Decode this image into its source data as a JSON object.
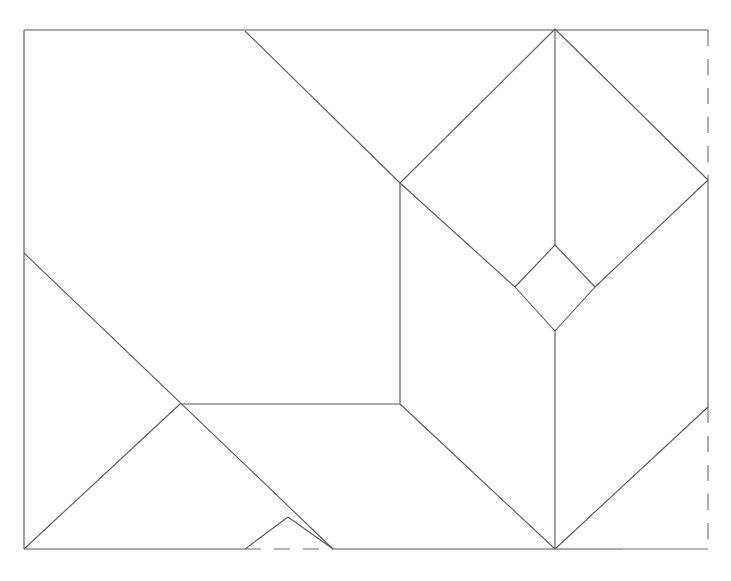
{
  "figure": {
    "kind": "line-diagram",
    "background_color": "#ffffff",
    "line_color": "#59595c",
    "dashed_line_color": "#6c6c70",
    "canvas": {
      "width": 731,
      "height": 581
    },
    "bounding_box": {
      "left": 24,
      "top": 30,
      "right": 708,
      "bottom": 549
    },
    "vertices": {
      "top_left": [
        24,
        30
      ],
      "top_right": [
        708,
        30
      ],
      "bottom_left": [
        24,
        549
      ],
      "bottom_right": [
        708,
        549
      ],
      "top_edge_crease": [
        245,
        31
      ],
      "apex_top": [
        555,
        29
      ],
      "left_edge_crease": [
        24,
        253
      ],
      "mid_left_node": [
        180,
        404
      ],
      "mid_right_node": [
        400,
        404
      ],
      "upper_mid_node": [
        400,
        183
      ],
      "right_diamond_node": [
        708,
        180
      ],
      "lower_right_node": [
        708,
        407
      ],
      "bottom_apex": [
        555,
        549
      ],
      "small_diamond_top": [
        555,
        245
      ],
      "small_diamond_left": [
        515,
        287
      ],
      "small_diamond_right": [
        595,
        287
      ],
      "small_diamond_bottom": [
        555,
        331
      ],
      "small_tri_apex": [
        288,
        517
      ],
      "small_tri_base_left": [
        245,
        549
      ],
      "small_tri_base_right": [
        333,
        549
      ]
    },
    "segments": [
      {
        "name": "outer-top-edge",
        "style": "solid",
        "from": [
          24,
          30
        ],
        "to": [
          708,
          30
        ]
      },
      {
        "name": "outer-left-edge",
        "style": "solid",
        "from": [
          24,
          30
        ],
        "to": [
          24,
          549
        ]
      },
      {
        "name": "outer-bottom-edge-left",
        "style": "solid",
        "from": [
          24,
          549
        ],
        "to": [
          245,
          549
        ]
      },
      {
        "name": "outer-bottom-edge-gap",
        "style": "dashed",
        "from": [
          245,
          549
        ],
        "to": [
          333,
          549
        ]
      },
      {
        "name": "outer-bottom-edge-mid",
        "style": "solid",
        "from": [
          333,
          549
        ],
        "to": [
          622,
          549
        ]
      },
      {
        "name": "outer-bottom-edge-right",
        "style": "solid-faint",
        "from": [
          622,
          549
        ],
        "to": [
          708,
          549
        ]
      },
      {
        "name": "outer-right-edge-upper",
        "style": "dashed",
        "from": [
          708,
          30
        ],
        "to": [
          708,
          180
        ]
      },
      {
        "name": "outer-right-edge-middle",
        "style": "solid",
        "from": [
          708,
          180
        ],
        "to": [
          708,
          407
        ]
      },
      {
        "name": "outer-right-edge-lower",
        "style": "dashed",
        "from": [
          708,
          407
        ],
        "to": [
          708,
          549
        ]
      },
      {
        "name": "crease-top-left-diagonal",
        "style": "solid",
        "from": [
          245,
          31
        ],
        "to": [
          400,
          183
        ]
      },
      {
        "name": "crease-apex-left-fold",
        "style": "solid",
        "from": [
          555,
          29
        ],
        "to": [
          400,
          183
        ]
      },
      {
        "name": "crease-apex-right-fold",
        "style": "solid",
        "from": [
          555,
          29
        ],
        "to": [
          708,
          180
        ]
      },
      {
        "name": "crease-apex-vertical-upper",
        "style": "solid",
        "from": [
          555,
          29
        ],
        "to": [
          555,
          245
        ]
      },
      {
        "name": "crease-vertical-spine",
        "style": "solid",
        "from": [
          400,
          183
        ],
        "to": [
          400,
          404
        ]
      },
      {
        "name": "crease-left-diamond-lower",
        "style": "solid",
        "from": [
          400,
          183
        ],
        "to": [
          515,
          287
        ]
      },
      {
        "name": "crease-diamond-top-left",
        "style": "solid",
        "from": [
          555,
          245
        ],
        "to": [
          515,
          287
        ]
      },
      {
        "name": "crease-diamond-top-right",
        "style": "solid",
        "from": [
          555,
          245
        ],
        "to": [
          595,
          287
        ]
      },
      {
        "name": "crease-diamond-bottom-left",
        "style": "solid",
        "from": [
          515,
          287
        ],
        "to": [
          555,
          331
        ]
      },
      {
        "name": "crease-diamond-bottom-right",
        "style": "solid",
        "from": [
          595,
          287
        ],
        "to": [
          555,
          331
        ]
      },
      {
        "name": "crease-right-diamond-upper",
        "style": "solid",
        "from": [
          595,
          287
        ],
        "to": [
          708,
          180
        ]
      },
      {
        "name": "crease-lower-vertical-spine",
        "style": "solid",
        "from": [
          555,
          331
        ],
        "to": [
          555,
          549
        ]
      },
      {
        "name": "crease-left-lower-fold",
        "style": "solid",
        "from": [
          400,
          404
        ],
        "to": [
          555,
          549
        ]
      },
      {
        "name": "crease-right-lower-fold",
        "style": "solid",
        "from": [
          708,
          407
        ],
        "to": [
          555,
          549
        ]
      },
      {
        "name": "crease-horizontal-shelf",
        "style": "solid",
        "from": [
          180,
          404
        ],
        "to": [
          400,
          404
        ]
      },
      {
        "name": "crease-left-edge-diagonal",
        "style": "solid",
        "from": [
          24,
          253
        ],
        "to": [
          333,
          549
        ]
      },
      {
        "name": "crease-bottomleft-diagonal",
        "style": "solid",
        "from": [
          24,
          549
        ],
        "to": [
          180,
          404
        ]
      },
      {
        "name": "crease-small-tri-left",
        "style": "solid",
        "from": [
          245,
          549
        ],
        "to": [
          288,
          517
        ]
      },
      {
        "name": "crease-small-tri-right",
        "style": "solid",
        "from": [
          288,
          517
        ],
        "to": [
          333,
          549
        ]
      }
    ]
  }
}
